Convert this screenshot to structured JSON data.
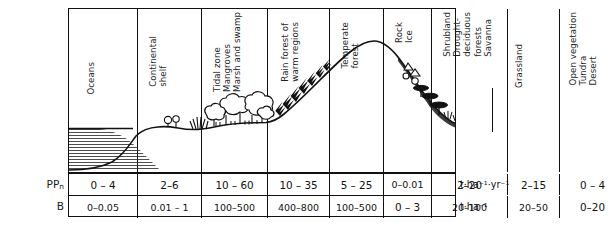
{
  "figure": {
    "type": "ecological-transect-profile"
  },
  "zones": [
    {
      "id": "oceans",
      "label": "Oceans",
      "x": 68,
      "width": 68
    },
    {
      "id": "continental-shelf",
      "label": "Continental\nshelf",
      "x": 136,
      "width": 64
    },
    {
      "id": "tidal-mangrove",
      "label": "Tidal zone\nMangroves\nMarsh and swamp",
      "x": 200,
      "width": 66
    },
    {
      "id": "rain-forest",
      "label": "Rain forest of\nwarm regions",
      "x": 266,
      "width": 62
    },
    {
      "id": "temperate-forest",
      "label": "Temperate\nforest",
      "x": 328,
      "width": 54
    },
    {
      "id": "rock-ice",
      "label": "Rock\nIce",
      "x": 382,
      "width": 48
    },
    {
      "id": "shrubland-savanna",
      "label": "Shrubland\nDrought-\ndeciduous\nforests\nSavanna",
      "secondary": "Grassland",
      "x": 430,
      "width": 76
    },
    {
      "id": "grassland",
      "label": "Grassland",
      "x": 506,
      "width": 52
    },
    {
      "id": "open-vegetation",
      "label": "Open vegetation\nTundra\nDesert",
      "x": 558,
      "width": 64
    }
  ],
  "table": {
    "row_keys": {
      "ppn": "PP",
      "ppn_sub": "n",
      "biomass": "B"
    },
    "units": {
      "ppn": "t·ha⁻¹·yr⁻¹",
      "biomass": "t·ha⁻¹"
    },
    "rows": [
      {
        "key": "ppn",
        "values": [
          "0 – 4",
          "2–6",
          "10 – 60",
          "10 – 35",
          "5 – 25",
          "0–0.01",
          "2–20",
          "2–15",
          "0 – 4"
        ]
      },
      {
        "key": "biomass",
        "values": [
          "0–0.05",
          "0.01 – 1",
          "100–500",
          "400–800",
          "100–500",
          "0 – 3",
          "20–100",
          "20–50",
          "0–20"
        ]
      }
    ]
  },
  "colors": {
    "line": "#111111",
    "background": "#ffffff",
    "water_hatch": "#333333"
  }
}
